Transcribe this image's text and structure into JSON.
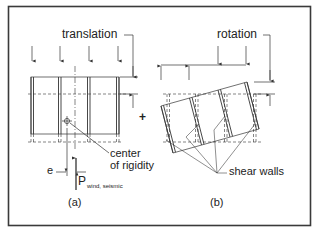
{
  "figure": {
    "frame_color": "#3a3a3a",
    "line_color": "#333333",
    "background": "#ffffff",
    "panel_a": {
      "heading": "translation",
      "caption": "(a)",
      "center_label_line1": "center",
      "center_label_line2": "of rigidity",
      "eccentricity_label": "e",
      "force_label": "P",
      "force_subscript": "wind, seismic"
    },
    "operator": "+",
    "panel_b": {
      "heading": "rotation",
      "caption": "(b)",
      "walls_label": "shear walls"
    }
  }
}
